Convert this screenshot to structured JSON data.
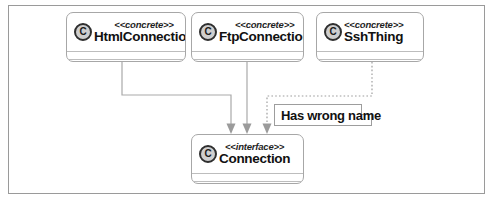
{
  "diagram": {
    "type": "uml-class-diagram",
    "frame": {
      "border_color": "#9a9a9a",
      "background": "#ffffff"
    },
    "classes": [
      {
        "id": "html-connection",
        "stereotype": "<<concrete>>",
        "name": "HtmlConnection",
        "icon": "class-c-icon",
        "icon_letter": "C"
      },
      {
        "id": "ftp-connection",
        "stereotype": "<<concrete>>",
        "name": "FtpConnection",
        "icon": "class-c-icon",
        "icon_letter": "C"
      },
      {
        "id": "ssh-thing",
        "stereotype": "<<concrete>>",
        "name": "SshThing",
        "icon": "class-c-icon",
        "icon_letter": "C"
      },
      {
        "id": "connection-interface",
        "stereotype": "<<interface>>",
        "name": "Connection",
        "icon": "class-c-icon",
        "icon_letter": "C"
      }
    ],
    "note": {
      "id": "wrong-name-note",
      "text": "Has wrong name"
    },
    "relationships": [
      {
        "from": "HtmlConnection",
        "to": "Connection",
        "style": "solid",
        "arrow": "filled-triangle-down"
      },
      {
        "from": "FtpConnection",
        "to": "Connection",
        "style": "solid",
        "arrow": "filled-triangle-down"
      },
      {
        "from": "SshThing",
        "to": "Connection",
        "style": "dotted",
        "arrow": "filled-triangle-down"
      }
    ],
    "colors": {
      "line": "#a9a9a9",
      "dotted_line": "#9e9e9e",
      "box_border": "#a7a7a7",
      "text": "#111111"
    }
  }
}
